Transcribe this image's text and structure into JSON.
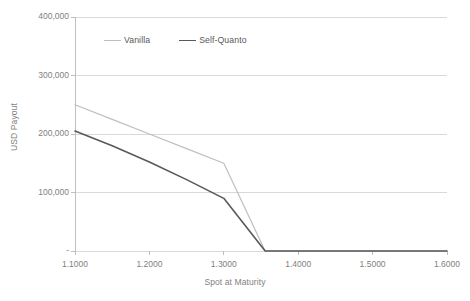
{
  "chart_data": {
    "type": "line",
    "title": "",
    "xlabel": "Spot at Maturity",
    "ylabel": "USD Payout",
    "xlim": [
      1.1,
      1.6
    ],
    "ylim": [
      0,
      400000
    ],
    "grid": true,
    "legend_position": "top-left-inside",
    "x_tick_labels": [
      "1.1000",
      "1.2000",
      "1.3000",
      "1.4000",
      "1.5000",
      "1.6000"
    ],
    "x_ticks": [
      1.1,
      1.2,
      1.3,
      1.4,
      1.5,
      1.6
    ],
    "y_tick_labels": [
      "-",
      "100,000",
      "200,000",
      "300,000",
      "400,000"
    ],
    "y_ticks": [
      0,
      100000,
      200000,
      300000,
      400000
    ],
    "series": [
      {
        "name": "Vanilla",
        "color": "#bfbfbf",
        "x": [
          1.1,
          1.15,
          1.2,
          1.25,
          1.3,
          1.3556,
          1.4,
          1.45,
          1.5,
          1.55,
          1.6
        ],
        "values": [
          250000,
          225000,
          200000,
          175000,
          150000,
          0,
          0,
          0,
          0,
          0,
          0
        ]
      },
      {
        "name": "Self-Quanto",
        "color": "#595959",
        "x": [
          1.1,
          1.15,
          1.2,
          1.25,
          1.3,
          1.3556,
          1.4,
          1.45,
          1.5,
          1.55,
          1.6
        ],
        "values": [
          205000,
          180000,
          152000,
          122000,
          90000,
          0,
          0,
          0,
          0,
          0,
          0
        ]
      }
    ]
  },
  "legend": {
    "items": [
      {
        "label": "Vanilla",
        "color": "#bfbfbf"
      },
      {
        "label": "Self-Quanto",
        "color": "#595959"
      }
    ]
  },
  "axes": {
    "y_title": "USD Payout",
    "x_title": "Spot at Maturity"
  },
  "colors": {
    "gridline": "#d9d9d9",
    "axis_line": "#bfbfbf",
    "tick_text": "#7f7f7f",
    "legend_text": "#595959",
    "background": "#ffffff"
  }
}
